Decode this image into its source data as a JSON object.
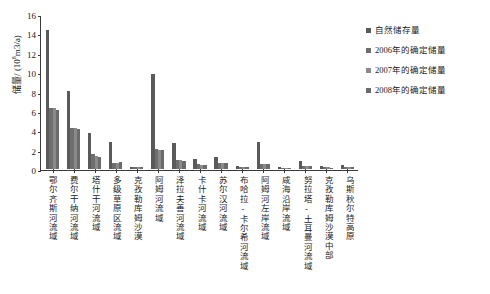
{
  "chart_data": {
    "type": "bar",
    "title": "",
    "xlabel": "",
    "ylabel_prefix": "储量/ (10",
    "ylabel_sup": "8",
    "ylabel_suffix": "m3/a)",
    "ylabel_full": "储量/ (108m3/a)",
    "ylim": [
      0,
      16
    ],
    "yticks": [
      0,
      2,
      4,
      6,
      8,
      10,
      12,
      14,
      16
    ],
    "grid": false,
    "legend_position": "top-right",
    "categories": [
      "鄂尔齐斯河流域",
      "费尔干纳河流域",
      "塔什干河流域",
      "多级草原区流域",
      "克孜勒库姆沙漠",
      "阿姆河流域",
      "泽拉夫善河流域",
      "卡什卡河流域",
      "苏尔汉河流域",
      "布哈拉-卡尔希河流域",
      "阿姆河左岸流域",
      "咸海沿岸流域",
      "努拉塔-土耳曼河流域",
      "克孜勒库姆沙漠中部",
      "乌斯秋尔特高原"
    ],
    "series": [
      {
        "name": "自然储存量",
        "color": "#5a5a5a",
        "values": [
          14.3,
          8.1,
          3.75,
          2.78,
          0.22,
          9.85,
          2.65,
          1.05,
          1.25,
          0.28,
          2.75,
          0.22,
          0.85,
          0.35,
          0.42
        ]
      },
      {
        "name": "2006年的确定储量",
        "color": "#6e6e6e",
        "values": [
          6.25,
          4.25,
          1.5,
          0.62,
          0.18,
          2.08,
          0.92,
          0.48,
          0.62,
          0.2,
          0.55,
          0.12,
          0.3,
          0.18,
          0.2
        ]
      },
      {
        "name": "2007年的确定储量",
        "color": "#8a8a8a",
        "values": [
          6.3,
          4.2,
          1.38,
          0.66,
          0.18,
          2.0,
          0.88,
          0.45,
          0.6,
          0.2,
          0.5,
          0.12,
          0.28,
          0.16,
          0.18
        ]
      },
      {
        "name": "2008年的确定储量",
        "color": "#6b6b6b",
        "values": [
          6.05,
          4.15,
          1.25,
          0.68,
          0.16,
          1.98,
          0.85,
          0.42,
          0.58,
          0.18,
          0.48,
          0.1,
          0.26,
          0.15,
          0.16
        ]
      }
    ]
  }
}
